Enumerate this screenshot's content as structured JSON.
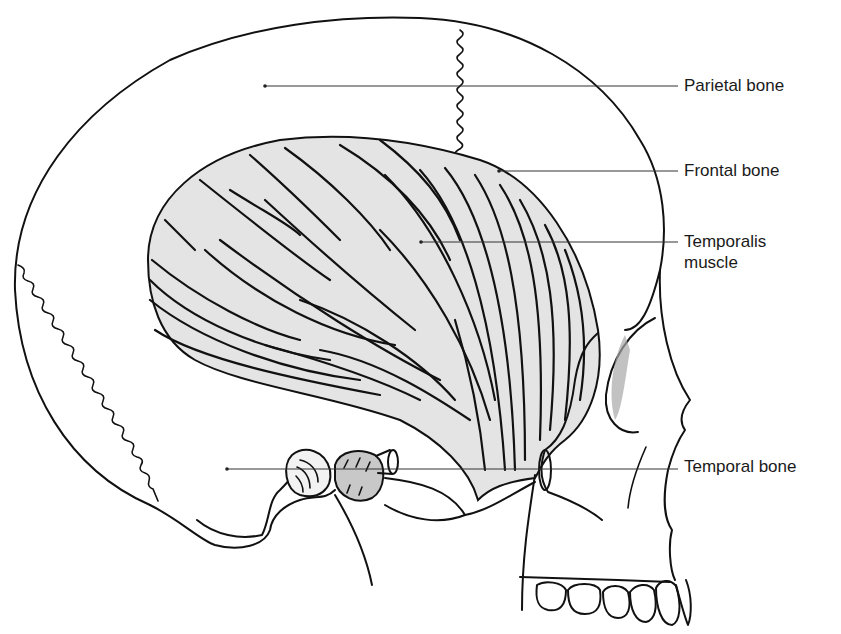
{
  "figure": {
    "colors": {
      "line": "#111111",
      "muscle_fill": "#e4e4e4",
      "condyle_fill": "#c8c8c8",
      "background": "#ffffff"
    }
  },
  "labels": [
    {
      "id": "parietal",
      "text": "Parietal bone",
      "x": 684,
      "y": 75,
      "pointer": {
        "x1": 265,
        "y1": 86,
        "x2": 678,
        "y2": 86
      }
    },
    {
      "id": "frontal",
      "text": "Frontal bone",
      "x": 684,
      "y": 160,
      "pointer": {
        "x1": 499,
        "y1": 171,
        "x2": 678,
        "y2": 171
      }
    },
    {
      "id": "temporalis",
      "text": "Temporalis\nmuscle",
      "x": 684,
      "y": 231,
      "pointer": {
        "x1": 421,
        "y1": 242,
        "x2": 678,
        "y2": 242
      }
    },
    {
      "id": "temporal",
      "text": "Temporal bone",
      "x": 684,
      "y": 456,
      "pointer": {
        "x1": 227,
        "y1": 469,
        "x2": 678,
        "y2": 469
      }
    }
  ]
}
